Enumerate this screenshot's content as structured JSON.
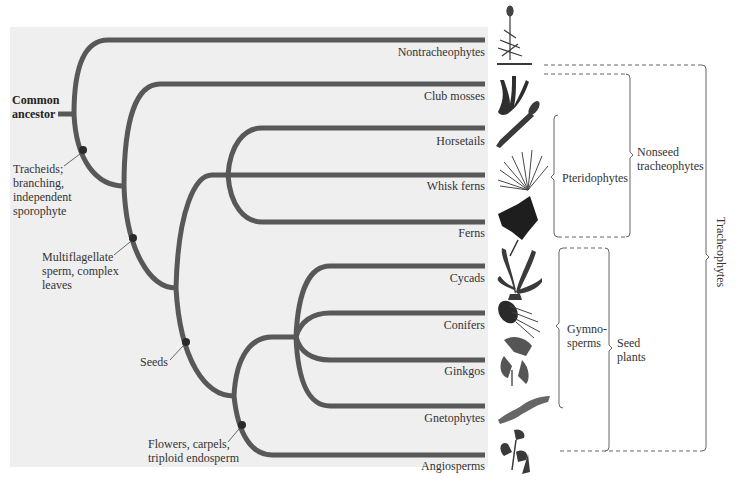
{
  "diagram": {
    "type": "phylogenetic-tree",
    "root_label": [
      "Common",
      "ancestor"
    ],
    "taxa": [
      {
        "name": "Nontracheophytes",
        "y": 40,
        "icon": "moss-icon"
      },
      {
        "name": "Club mosses",
        "y": 84,
        "icon": "club-moss-icon"
      },
      {
        "name": "Horsetails",
        "y": 128,
        "icon": "horsetail-icon"
      },
      {
        "name": "Whisk ferns",
        "y": 175,
        "icon": "whisk-fern-icon"
      },
      {
        "name": "Ferns",
        "y": 222,
        "icon": "fern-icon"
      },
      {
        "name": "Cycads",
        "y": 266,
        "icon": "cycad-icon"
      },
      {
        "name": "Conifers",
        "y": 313,
        "icon": "conifer-icon"
      },
      {
        "name": "Ginkgos",
        "y": 360,
        "icon": "ginkgo-icon"
      },
      {
        "name": "Gnetophytes",
        "y": 406,
        "icon": "gnetophyte-icon"
      },
      {
        "name": "Angiosperms",
        "y": 455,
        "icon": "angiosperm-icon"
      }
    ],
    "traits": [
      {
        "lines": [
          "Tracheids;",
          "branching,",
          "independent",
          "sporophyte"
        ]
      },
      {
        "lines": [
          "Multiflagellate",
          "sperm, complex",
          "leaves"
        ]
      },
      {
        "lines": [
          "Seeds"
        ]
      },
      {
        "lines": [
          "Flowers, carpels,",
          "triploid endosperm"
        ]
      }
    ],
    "groups": {
      "pteridophytes": "Pteridophytes",
      "nonseed": [
        "Nonseed",
        "tracheophytes"
      ],
      "gymnosperms": [
        "Gymno-",
        "sperms"
      ],
      "seed_plants": [
        "Seed",
        "plants"
      ],
      "tracheophytes": "Tracheophytes"
    },
    "colors": {
      "branch": "#585858",
      "node": "#2a2a2a",
      "panel": "#efefef",
      "bracket": "#555555"
    }
  }
}
